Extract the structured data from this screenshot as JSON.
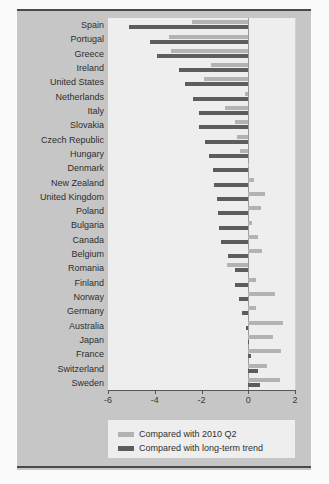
{
  "chart_data": {
    "type": "bar",
    "orientation": "horizontal",
    "title": "",
    "subtitle": "",
    "xlabel": "",
    "ylabel": "",
    "xlim": [
      -6,
      2
    ],
    "xticks": [
      -6,
      -4,
      -2,
      0,
      2
    ],
    "xtick_labels": [
      "-6",
      "-4",
      "-2",
      "0",
      "2"
    ],
    "grid": false,
    "legend_position": "bottom",
    "categories": [
      "Spain",
      "Portugal",
      "Greece",
      "Ireland",
      "United States",
      "Netherlands",
      "Italy",
      "Slovakia",
      "Czech Republic",
      "Hungary",
      "Denmark",
      "New Zealand",
      "United Kingdom",
      "Poland",
      "Bulgaria",
      "Canada",
      "Belgium",
      "Romania",
      "Finland",
      "Norway",
      "Germany",
      "Australia",
      "Japan",
      "France",
      "Switzerland",
      "Sweden"
    ],
    "series": [
      {
        "name": "Compared with 2010 Q2",
        "color": "#b3b3b3",
        "values": [
          -2.4,
          -3.4,
          -3.3,
          -1.6,
          -1.9,
          -0.15,
          -1.0,
          -0.55,
          -0.5,
          -0.35,
          0.05,
          0.25,
          0.7,
          0.55,
          0.15,
          0.4,
          0.6,
          -0.9,
          0.35,
          1.15,
          0.35,
          1.5,
          1.05,
          1.4,
          0.8,
          1.35
        ]
      },
      {
        "name": "Compared with long-term trend",
        "color": "#5d5d5d",
        "values": [
          -5.1,
          -4.2,
          -3.9,
          -2.95,
          -2.7,
          -2.35,
          -2.1,
          -2.1,
          -1.85,
          -1.7,
          -1.5,
          -1.45,
          -1.35,
          -1.3,
          -1.25,
          -1.15,
          -0.85,
          -0.55,
          -0.55,
          -0.4,
          -0.25,
          -0.1,
          -0.02,
          0.1,
          0.4,
          0.5
        ]
      }
    ]
  },
  "legend": {
    "items": [
      {
        "label": "Compared with 2010 Q2",
        "color": "#b3b3b3"
      },
      {
        "label": "Compared with long-term trend",
        "color": "#5d5d5d"
      }
    ]
  }
}
